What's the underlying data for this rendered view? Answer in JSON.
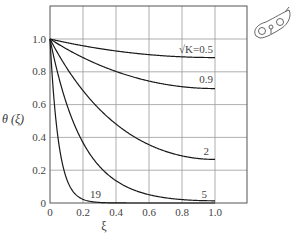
{
  "chart_data": {
    "type": "line",
    "title": "",
    "xlabel": "ξ",
    "ylabel": "θ (ξ)",
    "xlim": [
      0,
      1.2
    ],
    "ylim": [
      0,
      1.2
    ],
    "grid": true,
    "x_ticks": [
      "0",
      "0.2",
      "0.4",
      "0.6",
      "0.8",
      "1.0"
    ],
    "y_ticks": [
      "0",
      "0.2",
      "0.4",
      "0.6",
      "0.8",
      "1.0"
    ],
    "x": [
      0,
      0.1,
      0.2,
      0.3,
      0.4,
      0.5,
      0.6,
      0.7,
      0.8,
      0.9,
      1.0
    ],
    "series": [
      {
        "name": "√K=0.5",
        "label": "√K=0.5",
        "values": [
          1.0,
          0.958,
          0.921,
          0.89,
          0.865,
          0.845,
          0.83,
          0.819,
          0.813,
          0.888,
          0.887
        ]
      },
      {
        "name": "0.9",
        "label": "0.9",
        "values": [
          1.0,
          0.925,
          0.86,
          0.806,
          0.76,
          0.725,
          0.697,
          0.677,
          0.664,
          0.7,
          0.698
        ]
      },
      {
        "name": "2",
        "label": "2",
        "values": [
          1.0,
          0.816,
          0.668,
          0.55,
          0.457,
          0.385,
          0.332,
          0.295,
          0.273,
          0.27,
          0.266
        ]
      },
      {
        "name": "5",
        "label": "5",
        "values": [
          1.0,
          0.607,
          0.368,
          0.224,
          0.136,
          0.083,
          0.05,
          0.031,
          0.02,
          0.015,
          0.013
        ]
      },
      {
        "name": "19",
        "label": "19",
        "values": [
          1.0,
          0.15,
          0.022,
          0.003,
          0.0,
          0.0,
          0.0,
          0.0,
          0.0,
          0.0,
          0.0
        ]
      }
    ],
    "formula": "θ(ξ) = cosh(√K(1−ξ)) / cosh(√K)",
    "legend_position": "inline labels at curve ends"
  },
  "decoration": {
    "icon": "seed-sketch-icon"
  }
}
